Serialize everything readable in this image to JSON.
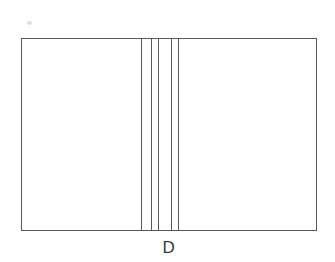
{
  "figure": {
    "caption": "D",
    "background_color": "#ffffff",
    "stroke_color": "#58585c",
    "smudge_color": "#d8d8da",
    "outer_rect": {
      "name": "outer-rectangle",
      "x": 21,
      "y": 38,
      "width": 296,
      "height": 193
    },
    "vertical_lines": [
      {
        "label": "line-1",
        "x": 141
      },
      {
        "label": "line-2",
        "x": 151
      },
      {
        "label": "line-3",
        "x": 158
      },
      {
        "label": "line-4",
        "x": 171
      },
      {
        "label": "line-5",
        "x": 178
      }
    ],
    "smudge": {
      "x": 27,
      "y": 21
    },
    "caption_position": {
      "x": 159,
      "y": 239,
      "width": 20
    }
  },
  "chart_data": {
    "type": "diagram",
    "title": "D",
    "canvas": {
      "width": 335,
      "height": 262
    },
    "shapes": [
      {
        "kind": "rectangle",
        "name": "outer-rectangle",
        "x": 21,
        "y": 38,
        "width": 296,
        "height": 193,
        "stroke": "#58585c",
        "stroke_width": 1,
        "fill": "none"
      },
      {
        "kind": "line",
        "name": "vertical-line-1",
        "x1": 141,
        "y1": 38,
        "x2": 141,
        "y2": 231,
        "stroke": "#55555a",
        "stroke_width": 1
      },
      {
        "kind": "line",
        "name": "vertical-line-2",
        "x1": 151,
        "y1": 38,
        "x2": 151,
        "y2": 231,
        "stroke": "#55555a",
        "stroke_width": 1
      },
      {
        "kind": "line",
        "name": "vertical-line-3",
        "x1": 158,
        "y1": 38,
        "x2": 158,
        "y2": 231,
        "stroke": "#55555a",
        "stroke_width": 1
      },
      {
        "kind": "line",
        "name": "vertical-line-4",
        "x1": 171,
        "y1": 38,
        "x2": 171,
        "y2": 231,
        "stroke": "#55555a",
        "stroke_width": 1
      },
      {
        "kind": "line",
        "name": "vertical-line-5",
        "x1": 178,
        "y1": 38,
        "x2": 178,
        "y2": 231,
        "stroke": "#55555a",
        "stroke_width": 1
      }
    ],
    "panels": [
      {
        "name": "left-panel",
        "x_start": 21,
        "x_end": 141,
        "width": 120
      },
      {
        "name": "strip-1",
        "x_start": 141,
        "x_end": 151,
        "width": 10
      },
      {
        "name": "strip-2",
        "x_start": 151,
        "x_end": 158,
        "width": 7
      },
      {
        "name": "strip-3",
        "x_start": 158,
        "x_end": 171,
        "width": 13
      },
      {
        "name": "strip-4",
        "x_start": 171,
        "x_end": 178,
        "width": 7
      },
      {
        "name": "right-panel",
        "x_start": 178,
        "x_end": 317,
        "width": 139
      }
    ],
    "annotations": [
      {
        "text": "D",
        "x": 169,
        "y": 248,
        "role": "figure-caption"
      }
    ]
  }
}
